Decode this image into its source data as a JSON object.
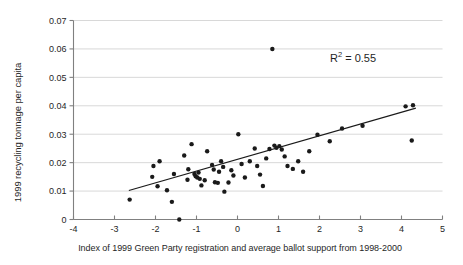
{
  "chart_data": {
    "type": "scatter",
    "title": "",
    "xlabel": "Index of 1999 Green Party registration and average ballot support from 1998-2000",
    "ylabel": "1999 recycling tonnage per capita",
    "xlim": [
      -4,
      5
    ],
    "ylim": [
      0,
      0.07
    ],
    "xticks": [
      -4,
      -3,
      -2,
      -1,
      0,
      1,
      2,
      3,
      4,
      5
    ],
    "xtick_labels": [
      "-4",
      "-3",
      "-2",
      "-1",
      "0",
      "1",
      "2",
      "3",
      "4",
      "5"
    ],
    "yticks": [
      0,
      0.01,
      0.02,
      0.03,
      0.04,
      0.05,
      0.06,
      0.07
    ],
    "ytick_labels": [
      "0",
      "0.01",
      "0.02",
      "0.03",
      "0.04",
      "0.05",
      "0.06",
      "0.07"
    ],
    "grid": "horizontal",
    "legend": "none",
    "annotations": [
      {
        "name": "r-squared",
        "prefix": "R",
        "superscript": "2",
        "suffix": " = 0.55",
        "value": 0.55,
        "x": 2.1,
        "y": 0.058
      }
    ],
    "marker": {
      "shape": "circle",
      "color": "#1a1a1a",
      "size": 3.4
    },
    "trendline": {
      "name": "linear-fit",
      "color": "#1a1a1a",
      "x_start": -2.65,
      "y_start": 0.0102,
      "x_end": 4.35,
      "y_end": 0.0392
    },
    "points": [
      {
        "x": -2.63,
        "y": 0.007
      },
      {
        "x": -2.08,
        "y": 0.015
      },
      {
        "x": -2.05,
        "y": 0.0188
      },
      {
        "x": -1.95,
        "y": 0.0117
      },
      {
        "x": -1.9,
        "y": 0.0205
      },
      {
        "x": -1.72,
        "y": 0.0103
      },
      {
        "x": -1.6,
        "y": 0.0062
      },
      {
        "x": -1.55,
        "y": 0.016
      },
      {
        "x": -1.42,
        "y": 0.0
      },
      {
        "x": -1.3,
        "y": 0.0225
      },
      {
        "x": -1.22,
        "y": 0.014
      },
      {
        "x": -1.2,
        "y": 0.0177
      },
      {
        "x": -1.12,
        "y": 0.0265
      },
      {
        "x": -1.05,
        "y": 0.016
      },
      {
        "x": -1.02,
        "y": 0.0152
      },
      {
        "x": -0.98,
        "y": 0.0148
      },
      {
        "x": -0.95,
        "y": 0.0165
      },
      {
        "x": -0.92,
        "y": 0.0143
      },
      {
        "x": -0.88,
        "y": 0.012
      },
      {
        "x": -0.8,
        "y": 0.0138
      },
      {
        "x": -0.74,
        "y": 0.024
      },
      {
        "x": -0.62,
        "y": 0.0192
      },
      {
        "x": -0.58,
        "y": 0.0176
      },
      {
        "x": -0.55,
        "y": 0.0131
      },
      {
        "x": -0.48,
        "y": 0.0129
      },
      {
        "x": -0.45,
        "y": 0.0168
      },
      {
        "x": -0.4,
        "y": 0.0205
      },
      {
        "x": -0.35,
        "y": 0.0185
      },
      {
        "x": -0.32,
        "y": 0.0098
      },
      {
        "x": -0.22,
        "y": 0.013
      },
      {
        "x": -0.15,
        "y": 0.0173
      },
      {
        "x": -0.1,
        "y": 0.0155
      },
      {
        "x": 0.02,
        "y": 0.03
      },
      {
        "x": 0.1,
        "y": 0.0195
      },
      {
        "x": 0.18,
        "y": 0.0148
      },
      {
        "x": 0.3,
        "y": 0.0205
      },
      {
        "x": 0.42,
        "y": 0.025
      },
      {
        "x": 0.48,
        "y": 0.0188
      },
      {
        "x": 0.55,
        "y": 0.0158
      },
      {
        "x": 0.62,
        "y": 0.0118
      },
      {
        "x": 0.7,
        "y": 0.0215
      },
      {
        "x": 0.78,
        "y": 0.0248
      },
      {
        "x": 0.85,
        "y": 0.06
      },
      {
        "x": 0.9,
        "y": 0.026
      },
      {
        "x": 0.95,
        "y": 0.0252
      },
      {
        "x": 1.02,
        "y": 0.0258
      },
      {
        "x": 1.08,
        "y": 0.0246
      },
      {
        "x": 1.15,
        "y": 0.0222
      },
      {
        "x": 1.22,
        "y": 0.0188
      },
      {
        "x": 1.35,
        "y": 0.0178
      },
      {
        "x": 1.48,
        "y": 0.0205
      },
      {
        "x": 1.6,
        "y": 0.0168
      },
      {
        "x": 1.75,
        "y": 0.024
      },
      {
        "x": 1.95,
        "y": 0.0298
      },
      {
        "x": 2.25,
        "y": 0.0275
      },
      {
        "x": 2.55,
        "y": 0.032
      },
      {
        "x": 3.05,
        "y": 0.033
      },
      {
        "x": 4.1,
        "y": 0.0398
      },
      {
        "x": 4.28,
        "y": 0.0402
      },
      {
        "x": 4.25,
        "y": 0.0278
      }
    ]
  }
}
